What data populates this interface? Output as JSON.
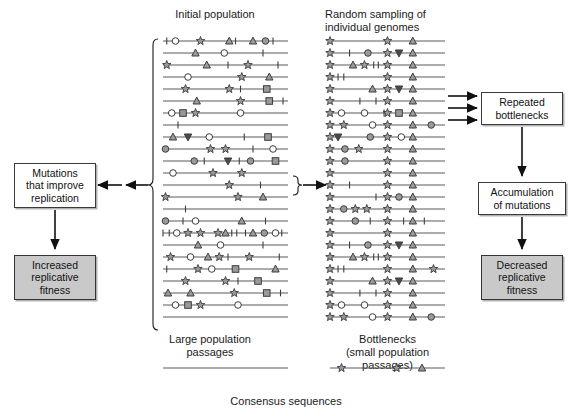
{
  "figure": {
    "title_top_left": "Initial population",
    "title_top_right": "Random sampling of\nindividual genomes",
    "label_bottom_left": "Large population\npassages",
    "label_bottom_right": "Bottlenecks\n(small population\npassages)",
    "label_consensus": "Consensus sequences"
  },
  "boxes": {
    "mutations_improve": "Mutations\nthat improve\nreplication",
    "increased_fitness": "Increased\nreplicative\nfitness",
    "repeated_bottlenecks": "Repeated\nbottlenecks",
    "accumulation": "Accumulation\nof mutations",
    "decreased_fitness": "Decreased\nreplicative\nfitness"
  },
  "colors": {
    "line": "#5a5a5a",
    "marker_fill": "#9a9a9a",
    "marker_stroke": "#3d3d3d",
    "open_fill": "#ffffff",
    "box_shaded": "#c9c9c9",
    "text": "#1a1a1a",
    "arrow": "#111111"
  },
  "chart_data": {
    "type": "diagram",
    "panel_left": {
      "x_start": 163,
      "x_end": 288,
      "row_y_start": 41,
      "row_spacing": 12.0,
      "row_count": 24,
      "rows": [
        [
          {
            "t": "tick",
            "x": 0.03
          },
          {
            "t": "circle_open",
            "x": 0.1
          },
          {
            "t": "star",
            "x": 0.3
          },
          {
            "t": "triangle",
            "x": 0.53
          },
          {
            "t": "tick",
            "x": 0.58
          },
          {
            "t": "triangle",
            "x": 0.72
          },
          {
            "t": "circle",
            "x": 0.82
          },
          {
            "t": "tick",
            "x": 0.88
          }
        ],
        [
          {
            "t": "triangle",
            "x": 0.26
          },
          {
            "t": "circle_open",
            "x": 0.49
          },
          {
            "t": "tick",
            "x": 0.8
          }
        ],
        [
          {
            "t": "star",
            "x": 0.03
          },
          {
            "t": "triangle",
            "x": 0.35
          },
          {
            "t": "tick",
            "x": 0.52
          },
          {
            "t": "star",
            "x": 0.68
          },
          {
            "t": "tick",
            "x": 0.92
          }
        ],
        [
          {
            "t": "circle_open",
            "x": 0.2
          },
          {
            "t": "star",
            "x": 0.63
          },
          {
            "t": "triangle",
            "x": 0.85
          }
        ],
        [
          {
            "t": "star",
            "x": 0.18
          },
          {
            "t": "star",
            "x": 0.53
          },
          {
            "t": "tick",
            "x": 0.62
          },
          {
            "t": "square",
            "x": 0.83
          }
        ],
        [
          {
            "t": "triangle",
            "x": 0.27
          },
          {
            "t": "star",
            "x": 0.62
          },
          {
            "t": "square",
            "x": 0.85
          },
          {
            "t": "tick",
            "x": 0.96
          }
        ],
        [
          {
            "t": "circle_open",
            "x": 0.07
          },
          {
            "t": "square",
            "x": 0.16
          },
          {
            "t": "star",
            "x": 0.26
          },
          {
            "t": "circle_open",
            "x": 0.62
          }
        ],
        [
          {
            "t": "tick",
            "x": 0.12
          }
        ],
        [
          {
            "t": "triangle",
            "x": 0.08
          },
          {
            "t": "triangle_down",
            "x": 0.2
          },
          {
            "t": "circle_open",
            "x": 0.37
          },
          {
            "t": "tick",
            "x": 0.65
          },
          {
            "t": "square",
            "x": 0.84
          }
        ],
        [
          {
            "t": "circle",
            "x": 0.02
          },
          {
            "t": "star",
            "x": 0.38
          },
          {
            "t": "star",
            "x": 0.5
          },
          {
            "t": "tick",
            "x": 0.72
          },
          {
            "t": "circle_open",
            "x": 0.88
          }
        ],
        [
          {
            "t": "circle",
            "x": 0.25
          },
          {
            "t": "tick",
            "x": 0.33
          },
          {
            "t": "triangle_down",
            "x": 0.52
          },
          {
            "t": "tick",
            "x": 0.61
          },
          {
            "t": "circle",
            "x": 0.7
          },
          {
            "t": "square",
            "x": 0.9
          }
        ],
        [
          {
            "t": "circle_open",
            "x": 0.08
          },
          {
            "t": "star",
            "x": 0.4
          },
          {
            "t": "star",
            "x": 0.63
          }
        ],
        [
          {
            "t": "star",
            "x": 0.53
          },
          {
            "t": "tick",
            "x": 0.78
          }
        ],
        [
          {
            "t": "star",
            "x": 0.02
          },
          {
            "t": "star",
            "x": 0.6
          },
          {
            "t": "triangle",
            "x": 0.8
          }
        ],
        [
          {
            "t": "tick",
            "x": 0.18
          }
        ],
        [
          {
            "t": "circle",
            "x": 0.02
          },
          {
            "t": "tick",
            "x": 0.16
          },
          {
            "t": "circle_open",
            "x": 0.26
          },
          {
            "t": "triangle",
            "x": 0.63
          },
          {
            "t": "tick",
            "x": 0.82
          }
        ],
        [
          {
            "t": "tick",
            "x": 0.0
          },
          {
            "t": "tick",
            "x": 0.05
          },
          {
            "t": "circle_open",
            "x": 0.11
          },
          {
            "t": "star",
            "x": 0.2
          },
          {
            "t": "star",
            "x": 0.3
          },
          {
            "t": "star",
            "x": 0.44
          },
          {
            "t": "triangle",
            "x": 0.5
          },
          {
            "t": "tick",
            "x": 0.55
          },
          {
            "t": "tick",
            "x": 0.59
          },
          {
            "t": "tick",
            "x": 0.66
          },
          {
            "t": "triangle",
            "x": 0.72
          },
          {
            "t": "circle",
            "x": 0.81
          },
          {
            "t": "circle_open",
            "x": 0.9
          },
          {
            "t": "tick",
            "x": 0.95
          }
        ],
        [
          {
            "t": "triangle",
            "x": 0.28
          },
          {
            "t": "circle_open",
            "x": 0.46
          },
          {
            "t": "tick",
            "x": 0.8
          }
        ],
        [
          {
            "t": "star",
            "x": 0.06
          },
          {
            "t": "circle_open",
            "x": 0.22
          },
          {
            "t": "triangle",
            "x": 0.36
          },
          {
            "t": "star",
            "x": 0.45
          },
          {
            "t": "tick",
            "x": 0.52
          },
          {
            "t": "star",
            "x": 0.69
          },
          {
            "t": "tick",
            "x": 0.93
          }
        ],
        [
          {
            "t": "tick",
            "x": 0.03
          },
          {
            "t": "star",
            "x": 0.28
          },
          {
            "t": "circle_open",
            "x": 0.39
          },
          {
            "t": "square",
            "x": 0.58
          },
          {
            "t": "triangle",
            "x": 0.9
          }
        ],
        [
          {
            "t": "star",
            "x": 0.18
          },
          {
            "t": "star",
            "x": 0.5
          },
          {
            "t": "tick",
            "x": 0.6
          },
          {
            "t": "square",
            "x": 0.76
          }
        ],
        [
          {
            "t": "triangle",
            "x": 0.04
          },
          {
            "t": "triangle",
            "x": 0.22
          },
          {
            "t": "star",
            "x": 0.57
          },
          {
            "t": "square",
            "x": 0.83
          },
          {
            "t": "tick",
            "x": 0.94
          }
        ],
        [
          {
            "t": "circle_open",
            "x": 0.1
          },
          {
            "t": "square",
            "x": 0.2
          },
          {
            "t": "star",
            "x": 0.3
          },
          {
            "t": "circle_open",
            "x": 0.6
          }
        ],
        [
          {
            "t": "none",
            "x": 0.5
          }
        ]
      ],
      "rows_extra": [
        [
          {
            "t": "triangle",
            "x": 0.08
          },
          {
            "t": "triangle_down",
            "x": 0.2
          },
          {
            "t": "circle_open",
            "x": 0.37
          },
          {
            "t": "tick",
            "x": 0.65
          },
          {
            "t": "square",
            "x": 0.84
          }
        ],
        [
          {
            "t": "circle",
            "x": 0.02
          },
          {
            "t": "star",
            "x": 0.38
          },
          {
            "t": "star",
            "x": 0.5
          },
          {
            "t": "tick",
            "x": 0.72
          },
          {
            "t": "circle_open",
            "x": 0.88
          }
        ],
        [
          {
            "t": "star",
            "x": 0.2
          },
          {
            "t": "circle_open",
            "x": 0.3
          },
          {
            "t": "tick",
            "x": 0.37
          },
          {
            "t": "triangle_down",
            "x": 0.55
          },
          {
            "t": "tick",
            "x": 0.63
          },
          {
            "t": "circle",
            "x": 0.72
          },
          {
            "t": "square",
            "x": 0.9
          }
        ]
      ]
    },
    "panel_right": {
      "x_start": 330,
      "x_end": 445,
      "row_y_start": 41,
      "row_spacing": 12.0,
      "row_count": 24,
      "conserved": [
        {
          "t": "star",
          "x": 0.0
        },
        {
          "t": "star",
          "x": 0.5
        },
        {
          "t": "triangle",
          "x": 0.72
        }
      ],
      "rows": [
        [],
        [
          {
            "t": "tick",
            "x": 0.17
          },
          {
            "t": "circle",
            "x": 0.33
          },
          {
            "t": "triangle_down",
            "x": 0.6
          }
        ],
        [
          {
            "t": "triangle",
            "x": 0.2
          },
          {
            "t": "star",
            "x": 0.3
          },
          {
            "t": "tick",
            "x": 0.38
          },
          {
            "t": "tick",
            "x": 0.42
          }
        ],
        [
          {
            "t": "tick",
            "x": 0.07
          },
          {
            "t": "tick",
            "x": 0.12
          }
        ],
        [
          {
            "t": "triangle",
            "x": 0.37
          },
          {
            "t": "triangle_down",
            "x": 0.6
          }
        ],
        [
          {
            "t": "tick",
            "x": 0.26
          },
          {
            "t": "tick",
            "x": 0.4
          }
        ],
        [
          {
            "t": "circle_open",
            "x": 0.1
          },
          {
            "t": "circle_open",
            "x": 0.3
          },
          {
            "t": "tick",
            "x": 0.47
          },
          {
            "t": "square",
            "x": 0.6
          }
        ],
        [
          {
            "t": "star",
            "x": 0.12
          },
          {
            "t": "circle_open",
            "x": 0.37
          },
          {
            "t": "circle",
            "x": 0.88
          }
        ],
        [
          {
            "t": "triangle_down",
            "x": 0.07
          },
          {
            "t": "circle",
            "x": 0.35
          },
          {
            "t": "circle_open",
            "x": 0.62
          }
        ],
        [
          {
            "t": "circle",
            "x": 0.13
          },
          {
            "t": "star",
            "x": 0.25
          }
        ],
        [
          {
            "t": "circle",
            "x": 0.13
          }
        ],
        [],
        [
          {
            "t": "tick",
            "x": 0.17
          }
        ],
        [
          {
            "t": "tick",
            "x": 0.4
          },
          {
            "t": "circle",
            "x": 0.6
          }
        ],
        [
          {
            "t": "circle",
            "x": 0.12
          },
          {
            "t": "star",
            "x": 0.22
          },
          {
            "t": "star",
            "x": 0.32
          }
        ],
        [
          {
            "t": "circle",
            "x": 0.22
          },
          {
            "t": "tick",
            "x": 0.35
          },
          {
            "t": "tick",
            "x": 0.64
          },
          {
            "t": "tick",
            "x": 0.82
          }
        ],
        [],
        [
          {
            "t": "tick",
            "x": 0.17
          },
          {
            "t": "circle",
            "x": 0.33
          },
          {
            "t": "triangle_down",
            "x": 0.6
          }
        ],
        [
          {
            "t": "triangle",
            "x": 0.2
          },
          {
            "t": "star",
            "x": 0.3
          },
          {
            "t": "tick",
            "x": 0.38
          },
          {
            "t": "tick",
            "x": 0.42
          }
        ],
        [
          {
            "t": "tick",
            "x": 0.07
          },
          {
            "t": "tick",
            "x": 0.12
          },
          {
            "t": "star",
            "x": 0.9
          }
        ],
        [
          {
            "t": "triangle",
            "x": 0.37
          },
          {
            "t": "triangle_down",
            "x": 0.6
          }
        ],
        [
          {
            "t": "tick",
            "x": 0.26
          },
          {
            "t": "tick",
            "x": 0.4
          }
        ],
        [
          {
            "t": "circle_open",
            "x": 0.1
          },
          {
            "t": "circle_open",
            "x": 0.3
          }
        ],
        [
          {
            "t": "star",
            "x": 0.12
          },
          {
            "t": "circle_open",
            "x": 0.37
          },
          {
            "t": "circle",
            "x": 0.88
          }
        ]
      ]
    },
    "consensus_left": {
      "x_start": 163,
      "x_end": 288,
      "y": 368,
      "markers": []
    },
    "consensus_right": {
      "x_start": 330,
      "x_end": 445,
      "y": 368,
      "markers": [
        {
          "t": "star",
          "x": 0.1
        },
        {
          "t": "star",
          "x": 0.58
        },
        {
          "t": "triangle",
          "x": 0.8
        }
      ]
    }
  }
}
